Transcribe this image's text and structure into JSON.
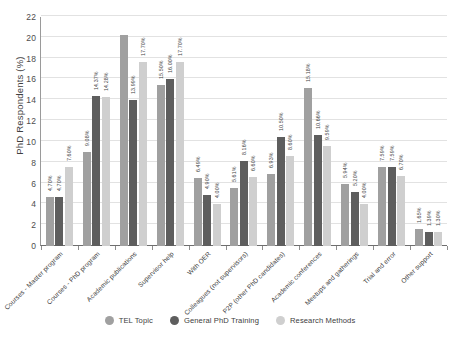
{
  "chart_data": {
    "type": "bar",
    "title": "",
    "xlabel": "",
    "ylabel": "PhD Respondents (%)",
    "ylim": [
      0,
      22
    ],
    "ytick_step": 2,
    "yticks": [
      0,
      2,
      4,
      6,
      8,
      10,
      12,
      14,
      16,
      18,
      20,
      22
    ],
    "grid": true,
    "legend_position": "bottom",
    "value_labels": true,
    "value_label_suffix": "%",
    "categories": [
      "Courses - Master program",
      "Courses - PhD program",
      "Academic publications",
      "Supervisor help",
      "With OER",
      "Colleagues (not supervisors)",
      "P2P (other PhD candidates)",
      "Academic conferences",
      "Meetups and gatherings",
      "Trial and error",
      "Other support"
    ],
    "series": [
      {
        "name": "TEL Topic",
        "color": "#a0a0a0",
        "values": [
          4.7,
          9.08,
          20.3,
          15.5,
          6.49,
          5.61,
          6.93,
          15.18,
          5.94,
          7.59,
          1.65
        ],
        "labels": [
          "4.70%",
          "9.08%",
          "",
          "15.50%",
          "6.49%",
          "5.61%",
          "6.93%",
          "15.18%",
          "5.94%",
          "7.59%",
          "1.65%"
        ]
      },
      {
        "name": "General PhD Training",
        "color": "#5e5e5e",
        "values": [
          4.7,
          14.37,
          13.99,
          16.0,
          4.9,
          8.16,
          10.5,
          10.66,
          5.2,
          7.59,
          1.39
        ],
        "labels": [
          "4.70%",
          "14.37%",
          "13.99%",
          "16.00%",
          "4.90%",
          "8.16%",
          "10.50%",
          "10.66%",
          "5.20%",
          "7.59%",
          "1.39%"
        ]
      },
      {
        "name": "Research Methods",
        "color": "#cfcfcf",
        "values": [
          7.6,
          14.28,
          17.7,
          17.7,
          4.0,
          6.6,
          8.6,
          9.59,
          4.0,
          6.7,
          1.3
        ],
        "labels": [
          "7.60%",
          "14.28%",
          "17.70%",
          "17.70%",
          "4.00%",
          "6.60%",
          "8.60%",
          "9.59%",
          "4.00%",
          "6.70%",
          "1.30%"
        ]
      }
    ]
  },
  "axis": {
    "y_title": "PhD Respondents (%)"
  }
}
